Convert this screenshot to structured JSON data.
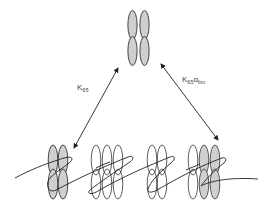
{
  "diagram": {
    "type": "reaction-equilibrium-schematic",
    "nodes": [
      {
        "id": "free-dimer-of-dimers",
        "position": "top-center",
        "subunits": 4,
        "shaded": 4
      },
      {
        "id": "bound-filament-left",
        "position": "bottom",
        "groups": [
          {
            "id": "group-1",
            "subunits": 4,
            "shaded": 4
          },
          {
            "id": "group-2",
            "subunits": 6,
            "shaded": 0
          },
          {
            "id": "group-3",
            "subunits": 4,
            "shaded": 0
          },
          {
            "id": "group-4",
            "subunits": 6,
            "shaded": 4
          }
        ]
      }
    ],
    "edges": [
      {
        "from": "top",
        "to": "bottom-left",
        "bidirectional": true,
        "label": {
          "main": "K",
          "sub": "65",
          "tail_main": "",
          "tail_sub": ""
        }
      },
      {
        "from": "top",
        "to": "bottom-right",
        "bidirectional": true,
        "label": {
          "main": "K",
          "sub": "65",
          "tail_main": "α",
          "tail_sub": "lim"
        }
      }
    ]
  },
  "labels": {
    "left": {
      "main": "K",
      "sub": "65"
    },
    "right": {
      "main": "K",
      "sub": "65",
      "tail_main": "α",
      "tail_sub": "lim"
    }
  },
  "colors": {
    "shaded_fill": "#cfcfcf",
    "outline": "#333333",
    "line": "#222222",
    "background": "#ffffff"
  }
}
